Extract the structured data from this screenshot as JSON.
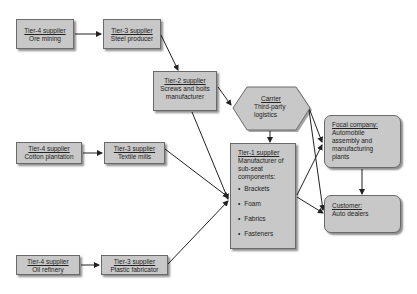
{
  "diagram": {
    "colors": {
      "box_fill": "#c8c8c8",
      "box_border": "#6a6a6a",
      "arrow": "#222222"
    },
    "nodes": {
      "ore_mining": {
        "title": "Tier-4 supplier",
        "desc": "Ore mining"
      },
      "steel_producer": {
        "title": "Tier-3 supplier",
        "desc": "Steel producer"
      },
      "screws": {
        "title": "Tier-2 supplier",
        "desc": "Screws and bolts manufacturer"
      },
      "carrier": {
        "title": "Carrier",
        "desc": "Third-party logistics"
      },
      "focal": {
        "title": "Focal company:",
        "desc": "Automobile assembly and manufacturing plants"
      },
      "tier1": {
        "title": "Tier-1 supplier",
        "desc": "Manufacturer of sub-seat components:",
        "items": [
          "Brackets",
          "Foam",
          "Fabrics",
          "Fasteners"
        ]
      },
      "customer": {
        "title": "Customer:",
        "desc": "Auto dealers"
      },
      "cotton": {
        "title": "Tier-4 supplier",
        "desc": "Cotton plantation"
      },
      "textile": {
        "title": "Tier-3 supplier",
        "desc": "Textile mills"
      },
      "oil": {
        "title": "Tier-4 supplier",
        "desc": "Oil refinery"
      },
      "plastic": {
        "title": "Tier-3 supplier",
        "desc": "Plastic fabricator"
      }
    },
    "edges": [
      [
        "ore_mining",
        "steel_producer"
      ],
      [
        "steel_producer",
        "screws"
      ],
      [
        "screws",
        "carrier"
      ],
      [
        "screws",
        "tier1"
      ],
      [
        "cotton",
        "textile"
      ],
      [
        "textile",
        "tier1"
      ],
      [
        "oil",
        "plastic"
      ],
      [
        "plastic",
        "tier1"
      ],
      [
        "carrier",
        "tier1"
      ],
      [
        "carrier",
        "focal"
      ],
      [
        "carrier",
        "customer"
      ],
      [
        "tier1",
        "focal"
      ],
      [
        "tier1",
        "customer"
      ],
      [
        "focal",
        "customer"
      ]
    ]
  }
}
